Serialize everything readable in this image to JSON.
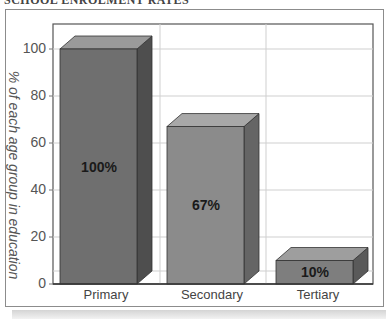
{
  "header": {
    "cut_title": "SCHOOL ENROLMENT RATES"
  },
  "chart_data": {
    "type": "bar",
    "style": "3d",
    "title": "",
    "categories": [
      "Primary",
      "Secondary",
      "Tertiary"
    ],
    "values": [
      100,
      67,
      10
    ],
    "value_labels": [
      "100%",
      "67%",
      "10%"
    ],
    "xlabel": "",
    "ylabel": "% of each age group in education",
    "ylim": [
      0,
      100
    ],
    "yticks": [
      0,
      20,
      40,
      60,
      80,
      100
    ],
    "grid": true,
    "legend": null,
    "colors": {
      "bar_fronts": [
        "#6f6f6f",
        "#8b8b8b",
        "#7e7e7e"
      ],
      "bar_tops": [
        "#9a9a9a",
        "#a8a8a8",
        "#9e9e9e"
      ],
      "bar_sides": [
        "#4e4e4e",
        "#656565",
        "#5a5a5a"
      ],
      "grid": "#cfcfcf",
      "frame": "#555555"
    }
  },
  "labels": {
    "ylabel": "% of each age group in education",
    "ticks": [
      "100",
      "80",
      "60",
      "40",
      "20",
      "0"
    ],
    "categories": [
      "Primary",
      "Secondary",
      "Tertiary"
    ],
    "values": [
      "100%",
      "67%",
      "10%"
    ]
  }
}
